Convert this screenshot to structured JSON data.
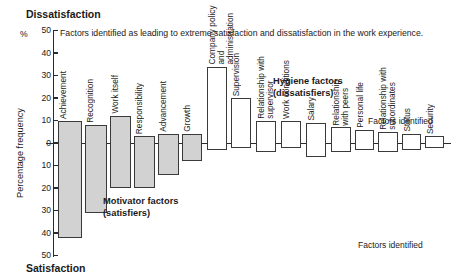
{
  "title_top": "Dissatisfaction",
  "title_bottom": "Satisfaction",
  "subtitle": "Factors identified as leading to extreme satisfaction and dissatisfaction in the work experience.",
  "percent_sign": "%",
  "y_axis_title": "Percentage frequency",
  "annotations": {
    "motivator": "Motivator factors\n(satisfiers)",
    "hygiene": "Hygiene factors\n(dissatisfiers)",
    "factors_identified_top": "Factors identified",
    "factors_identified_bottom": "Factors identified"
  },
  "colors": {
    "motivator_fill": "#d2d2d2",
    "hygiene_fill": "#ffffff",
    "outline": "#3a3a3a",
    "axis": "#2b2b2b",
    "text": "#1a1a1a"
  },
  "chart_data": {
    "type": "bar",
    "subtitle": "Factors identified as leading to extreme satisfaction and dissatisfaction in the work experience.",
    "xlabel": "Factors identified",
    "ylabel": "Percentage frequency",
    "ylim": [
      -50,
      50
    ],
    "y_ticks_top": [
      50,
      40,
      30,
      20,
      10,
      0
    ],
    "y_ticks_bottom": [
      10,
      20,
      30,
      40,
      50
    ],
    "y_tick_labels": [
      "50",
      "40",
      "30",
      "20",
      "10",
      "0",
      "10",
      "20",
      "30",
      "40",
      "50"
    ],
    "note_on_axis": "Axis is mirrored: upward = dissatisfaction %, downward = satisfaction %; tick labels are unsigned magnitudes.",
    "grid": false,
    "legend_position": "none",
    "orientation": "vertical-diverging",
    "groups": [
      {
        "name": "Motivator factors (satisfiers)",
        "fill": "#d2d2d2"
      },
      {
        "name": "Hygiene factors (dissatisfiers)",
        "fill": "#ffffff"
      }
    ],
    "categories": [
      "Achievement",
      "Recognition",
      "Work itself",
      "Responsibility",
      "Advancement",
      "Growth",
      "Company policy and administration",
      "Supervision",
      "Relationship with supervisor",
      "Work conditions",
      "Salary",
      "Relationship with peers",
      "Personal life",
      "Relationship with subordinates",
      "Status",
      "Security"
    ],
    "series": [
      {
        "name": "Dissatisfaction (above zero, %)",
        "values": [
          10,
          8,
          12,
          3,
          4,
          4,
          34,
          20,
          10,
          10,
          9,
          7,
          6,
          5,
          4,
          3
        ]
      },
      {
        "name": "Satisfaction (below zero, %)",
        "values": [
          42,
          31,
          20,
          20,
          14,
          8,
          3,
          2,
          4,
          2,
          6,
          4,
          3,
          4,
          3,
          2
        ]
      }
    ],
    "bars": [
      {
        "label": "Achievement",
        "label_lines": "Achievement",
        "group": "motivator",
        "up": 10,
        "down": 42,
        "x": 58,
        "w": 24
      },
      {
        "label": "Recognition",
        "label_lines": "Recognition",
        "group": "motivator",
        "up": 8,
        "down": 31,
        "x": 85,
        "w": 22
      },
      {
        "label": "Work itself",
        "label_lines": "Work itself",
        "group": "motivator",
        "up": 12,
        "down": 20,
        "x": 110,
        "w": 21
      },
      {
        "label": "Responsibility",
        "label_lines": "Responsibility",
        "group": "motivator",
        "up": 3,
        "down": 20,
        "x": 134,
        "w": 21
      },
      {
        "label": "Advancement",
        "label_lines": "Advancement",
        "group": "motivator",
        "up": 4,
        "down": 14,
        "x": 158,
        "w": 21
      },
      {
        "label": "Growth",
        "label_lines": "Growth",
        "group": "motivator",
        "up": 4,
        "down": 8,
        "x": 182,
        "w": 20
      },
      {
        "label": "Company policy and administration",
        "label_lines": "Company policy and\nadministration",
        "group": "hygiene",
        "up": 34,
        "down": 3,
        "x": 207,
        "w": 20
      },
      {
        "label": "Supervision",
        "label_lines": "Supervision",
        "group": "hygiene",
        "up": 20,
        "down": 2,
        "x": 231,
        "w": 20
      },
      {
        "label": "Relationship with supervisor",
        "label_lines": "Relationship with\nsupervisor",
        "group": "hygiene",
        "up": 10,
        "down": 4,
        "x": 256,
        "w": 20
      },
      {
        "label": "Work conditions",
        "label_lines": "Work conditions",
        "group": "hygiene",
        "up": 10,
        "down": 2,
        "x": 281,
        "w": 20
      },
      {
        "label": "Salary",
        "label_lines": "Salary",
        "group": "hygiene",
        "up": 9,
        "down": 6,
        "x": 306,
        "w": 20
      },
      {
        "label": "Relationship with peers",
        "label_lines": "Relationship\nwith peers",
        "group": "hygiene",
        "up": 7,
        "down": 4,
        "x": 331,
        "w": 20
      },
      {
        "label": "Personal life",
        "label_lines": "Personal life",
        "group": "hygiene",
        "up": 6,
        "down": 3,
        "x": 355,
        "w": 19
      },
      {
        "label": "Relationship with subordinates",
        "label_lines": "Relationship with\nsubordinates",
        "group": "hygiene",
        "up": 5,
        "down": 4,
        "x": 378,
        "w": 20
      },
      {
        "label": "Status",
        "label_lines": "Status",
        "group": "hygiene",
        "up": 4,
        "down": 3,
        "x": 402,
        "w": 19
      },
      {
        "label": "Security",
        "label_lines": "Security",
        "group": "hygiene",
        "up": 3,
        "down": 2,
        "x": 425,
        "w": 19
      }
    ]
  }
}
